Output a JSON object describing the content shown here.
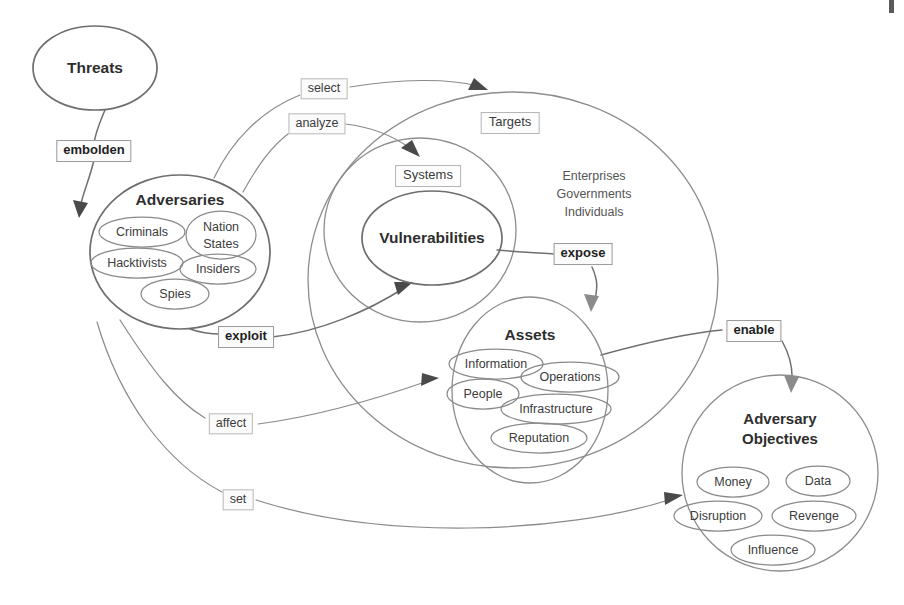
{
  "diagram": {
    "type": "concept-map",
    "title_visible": false,
    "background_color": "#ffffff",
    "stroke_color": "#6e6e6e",
    "text_color": "#3a3a3a",
    "nodes": [
      {
        "id": "threats",
        "label": "Threats",
        "shape": "ellipse",
        "style": "bold-title",
        "cx": 95,
        "cy": 68,
        "rx": 62,
        "ry": 42,
        "children": []
      },
      {
        "id": "adversaries",
        "label": "Adversaries",
        "shape": "ellipse",
        "style": "bold-title",
        "cx": 180,
        "cy": 252,
        "rx": 90,
        "ry": 77,
        "children": [
          {
            "label": "Criminals",
            "cx": 142,
            "cy": 232,
            "rx": 43,
            "ry": 15
          },
          {
            "label": "Nation\nStates",
            "line1": "Nation",
            "line2": "States",
            "cx": 221,
            "cy": 235,
            "rx": 35,
            "ry": 24
          },
          {
            "label": "Hacktivists",
            "cx": 137,
            "cy": 263,
            "rx": 46,
            "ry": 15
          },
          {
            "label": "Insiders",
            "cx": 218,
            "cy": 269,
            "rx": 38,
            "ry": 15
          },
          {
            "label": "Spies",
            "cx": 175,
            "cy": 294,
            "rx": 34,
            "ry": 15
          }
        ]
      },
      {
        "id": "targets",
        "label": "Targets",
        "shape": "ellipse",
        "style": "boxed-label",
        "cx": 513,
        "cy": 280,
        "rx": 205,
        "ry": 188,
        "label_x": 510,
        "label_y": 123,
        "children": []
      },
      {
        "id": "systems",
        "label": "Systems",
        "shape": "ellipse",
        "style": "boxed-label",
        "cx": 420,
        "cy": 230,
        "rx": 96,
        "ry": 92,
        "label_x": 428,
        "label_y": 176,
        "children": []
      },
      {
        "id": "vulnerabilities",
        "label": "Vulnerabilities",
        "shape": "ellipse",
        "style": "bold-title",
        "cx": 432,
        "cy": 238,
        "rx": 70,
        "ry": 47,
        "children": []
      },
      {
        "id": "assets",
        "label": "Assets",
        "shape": "ellipse",
        "style": "bold-title",
        "cx": 530,
        "cy": 390,
        "rx": 78,
        "ry": 93,
        "children": [
          {
            "label": "Information",
            "cx": 496,
            "cy": 364,
            "rx": 47,
            "ry": 15
          },
          {
            "label": "Operations",
            "cx": 570,
            "cy": 377,
            "rx": 49,
            "ry": 15
          },
          {
            "label": "People",
            "cx": 483,
            "cy": 394,
            "rx": 36,
            "ry": 15
          },
          {
            "label": "Infrastructure",
            "cx": 556,
            "cy": 409,
            "rx": 55,
            "ry": 15
          },
          {
            "label": "Reputation",
            "cx": 539,
            "cy": 438,
            "rx": 48,
            "ry": 15
          }
        ]
      },
      {
        "id": "adversary-objectives",
        "label": "Adversary\nObjectives",
        "line1": "Adversary",
        "line2": "Objectives",
        "shape": "ellipse",
        "style": "bold-title",
        "cx": 780,
        "cy": 473,
        "rx": 98,
        "ry": 98,
        "children": [
          {
            "label": "Money",
            "cx": 733,
            "cy": 482,
            "rx": 36,
            "ry": 15
          },
          {
            "label": "Data",
            "cx": 818,
            "cy": 481,
            "rx": 32,
            "ry": 15
          },
          {
            "label": "Disruption",
            "cx": 718,
            "cy": 516,
            "rx": 44,
            "ry": 15
          },
          {
            "label": "Revenge",
            "cx": 814,
            "cy": 516,
            "rx": 42,
            "ry": 15
          },
          {
            "label": "Influence",
            "cx": 773,
            "cy": 550,
            "rx": 42,
            "ry": 15
          }
        ]
      }
    ],
    "free_text": [
      {
        "id": "target-kinds",
        "lines": [
          "Enterprises",
          "Governments",
          "Individuals"
        ],
        "x": 594,
        "y": 194
      }
    ],
    "edges": [
      {
        "id": "embolden",
        "label": "embolden",
        "from": "threats",
        "to": "adversaries",
        "style": "bold",
        "label_x": 94,
        "label_y": 151
      },
      {
        "id": "select",
        "label": "select",
        "from": "adversaries",
        "to": "targets",
        "style": "normal",
        "label_x": 324,
        "label_y": 89
      },
      {
        "id": "analyze",
        "label": "analyze",
        "from": "adversaries",
        "to": "systems",
        "style": "normal",
        "label_x": 317,
        "label_y": 124
      },
      {
        "id": "exploit",
        "label": "exploit",
        "from": "adversaries",
        "to": "vulnerabilities",
        "style": "bold",
        "label_x": 246,
        "label_y": 337
      },
      {
        "id": "affect",
        "label": "affect",
        "from": "adversaries",
        "to": "assets",
        "style": "normal",
        "label_x": 231,
        "label_y": 424
      },
      {
        "id": "set",
        "label": "set",
        "from": "adversaries",
        "to": "adversary-objectives",
        "style": "normal",
        "label_x": 238,
        "label_y": 500
      },
      {
        "id": "expose",
        "label": "expose",
        "from": "vulnerabilities",
        "to": "assets",
        "style": "bold",
        "label_x": 583,
        "label_y": 254
      },
      {
        "id": "enable",
        "label": "enable",
        "from": "assets",
        "to": "adversary-objectives",
        "style": "bold",
        "label_x": 754,
        "label_y": 331
      }
    ]
  }
}
